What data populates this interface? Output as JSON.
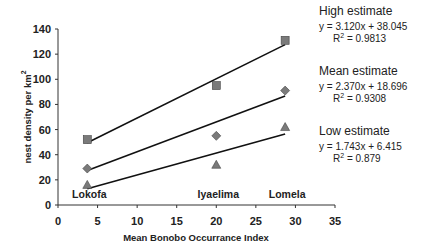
{
  "chart_data": {
    "type": "scatter",
    "title": "",
    "xlabel": "Mean Bonobo  Occurrance Index",
    "ylabel": "nest density per km",
    "ylabel_superscript": "2",
    "xlim": [
      0,
      35
    ],
    "ylim": [
      0,
      140
    ],
    "x_ticks": [
      0,
      5,
      10,
      15,
      20,
      25,
      30,
      35
    ],
    "y_ticks": [
      0,
      20,
      40,
      60,
      80,
      100,
      120,
      140
    ],
    "grid": false,
    "sites": [
      {
        "name": "Lokofa",
        "x": 3.7
      },
      {
        "name": "Iyaelima",
        "x": 20
      },
      {
        "name": "Lomela",
        "x": 28.7
      }
    ],
    "series": [
      {
        "name": "High estimate",
        "marker": "square",
        "x": [
          3.7,
          20,
          28.7
        ],
        "values": [
          52,
          95,
          131
        ],
        "trend": {
          "slope": 3.12,
          "intercept": 38.045,
          "equation": "y = 3.120x + 38.045",
          "r2_label": "R",
          "r2_value": " = 0.9813"
        }
      },
      {
        "name": "Mean estimate",
        "marker": "diamond",
        "x": [
          3.7,
          20,
          28.7
        ],
        "values": [
          29,
          55,
          91
        ],
        "trend": {
          "slope": 2.37,
          "intercept": 18.696,
          "equation": "y = 2.370x + 18.696",
          "r2_label": "R",
          "r2_value": " = 0.9308"
        }
      },
      {
        "name": "Low estimate",
        "marker": "triangle",
        "x": [
          3.7,
          20,
          28.7
        ],
        "values": [
          16,
          32,
          62
        ],
        "trend": {
          "slope": 1.743,
          "intercept": 6.415,
          "equation": "y = 1.743x + 6.415",
          "r2_label": "R",
          "r2_value": " = 0.879"
        }
      }
    ],
    "legend_position": "right"
  },
  "colors": {
    "marker_fill": "#7a7a7a",
    "line": "#111111",
    "axis": "#333333",
    "text": "#222222"
  }
}
